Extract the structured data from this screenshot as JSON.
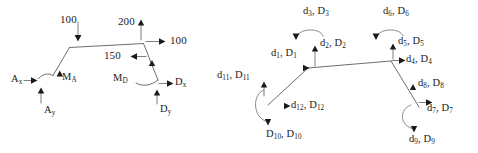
{
  "figure": {
    "background_color": "#ffffff",
    "line_color": "#6e6e6e",
    "arrow_color": "#1a1a1a"
  },
  "left_diagram": {
    "name": "numeric-load-frame",
    "labels": {
      "load_top_left": "100",
      "load_top_right": "200",
      "load_right_horizontal": "100",
      "moment_middle": "150",
      "reaction_ax": "A",
      "reaction_ax_sub": "x",
      "reaction_ay": "A",
      "reaction_ay_sub": "y",
      "moment_a": "M",
      "moment_a_sub": "A",
      "moment_d": "M",
      "moment_d_sub": "D",
      "reaction_dx": "D",
      "reaction_dx_sub": "x",
      "reaction_dy": "D",
      "reaction_dy_sub": "y"
    }
  },
  "right_diagram": {
    "name": "symbolic-displacement-frame",
    "labels": {
      "d1": "d",
      "d1_sub": "1",
      "D1": "D",
      "D1_sub": "1",
      "d2": "d",
      "d2_sub": "2",
      "D2": "D",
      "D2_sub": "2",
      "d3": "d",
      "d3_sub": "3",
      "D3": "D",
      "D3_sub": "3",
      "d4": "d",
      "d4_sub": "4",
      "D4": "D",
      "D4_sub": "4",
      "d5": "d",
      "d5_sub": "5",
      "D5": "D",
      "D5_sub": "5",
      "d6": "d",
      "d6_sub": "6",
      "D6": "D",
      "D6_sub": "6",
      "d7": "d",
      "d7_sub": "7",
      "D7": "D",
      "D7_sub": "7",
      "d8": "d",
      "d8_sub": "8",
      "D8": "D",
      "D8_sub": "8",
      "d9": "d",
      "d9_sub": "9",
      "D9": "D",
      "D9_sub": "9",
      "d10": "D",
      "d10_sub": "10",
      "D10": "D",
      "D10_sub": "10",
      "d11": "d",
      "d11_sub": "11",
      "D11": "D",
      "D11_sub": "11",
      "d12": "d",
      "d12_sub": "12",
      "D12": "D",
      "D12_sub": "12",
      "sep": ", "
    }
  }
}
